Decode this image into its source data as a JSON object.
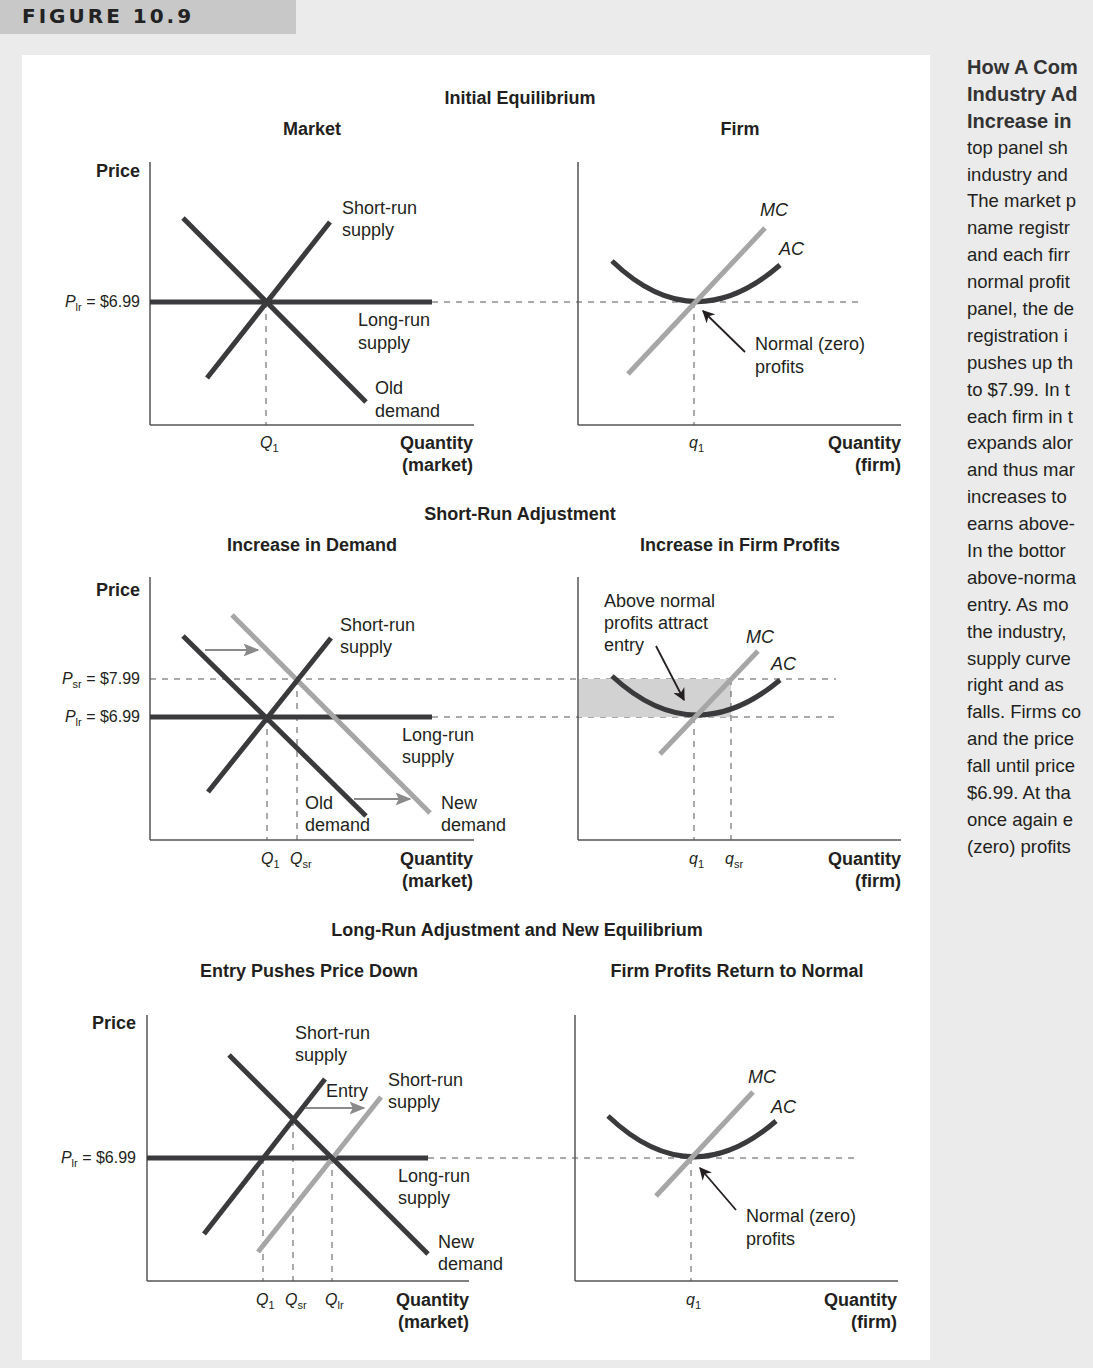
{
  "figure": {
    "label": "FIGURE 10.9",
    "caption_lines": [
      "How A Com",
      "Industry Ad",
      "Increase in",
      "top panel sh",
      "industry and",
      "The market p",
      "name registr",
      "and each firr",
      "normal profit",
      "panel, the de",
      "registration i",
      "pushes up th",
      "to $7.99. In t",
      "each firm in t",
      "expands alor",
      "and thus mar",
      "increases to",
      "earns above-",
      "In the bottor",
      "above-norma",
      "entry. As mo",
      "the industry,",
      "supply curve",
      "right and as",
      "falls. Firms co",
      "and the price",
      "fall until price",
      "$6.99. At tha",
      "once again e",
      "(zero) profits"
    ],
    "caption_bold_lines": 3
  },
  "rows": [
    {
      "title": "Initial Equilibrium",
      "market_title": "Market",
      "firm_title": "Firm"
    },
    {
      "title": "Short-Run Adjustment",
      "market_title": "Increase in Demand",
      "firm_title": "Increase in Firm Profits"
    },
    {
      "title": "Long-Run Adjustment and New Equilibrium",
      "market_title": "Entry Pushes Price Down",
      "firm_title": "Firm Profits Return to Normal"
    }
  ],
  "labels": {
    "price": "Price",
    "quantity": "Quantity",
    "market_paren": "(market)",
    "firm_paren": "(firm)",
    "p_lr_main": "P",
    "p_lr_sub": "lr",
    "p_lr_value": " = $6.99",
    "p_sr_main": "P",
    "p_sr_sub": "sr",
    "p_sr_value": " = $7.99",
    "Q": "Q",
    "q": "q",
    "sub_1": "1",
    "sub_sr": "sr",
    "sub_lr": "lr",
    "short_run": "Short-run",
    "supply": "supply",
    "long_run": "Long-run",
    "old": "Old",
    "new": "New",
    "demand": "demand",
    "mc": "MC",
    "ac": "AC",
    "normal_zero": "Normal (zero)",
    "profits": "profits",
    "above_normal": "Above normal",
    "profits_attract": "profits attract",
    "entry_lc": "entry",
    "entry": "Entry"
  },
  "colors": {
    "dark_curve": "#3a3a3c",
    "light_curve": "#a6a6a6",
    "arrow_gray": "#8a8a8a",
    "profit_shade": "#d2d2d2",
    "page_bg": "#ebebeb",
    "header_bg": "#c8c8c8"
  },
  "chart_data": [
    {
      "type": "line",
      "title": "Initial Equilibrium — Market",
      "xlabel": "Quantity (market)",
      "ylabel": "Price",
      "y_ticks": [
        "P_lr = $6.99"
      ],
      "x_ticks": [
        "Q1"
      ],
      "series": [
        {
          "name": "Short-run supply",
          "slope": "up"
        },
        {
          "name": "Long-run supply",
          "value": 6.99,
          "slope": "flat"
        },
        {
          "name": "Old demand",
          "slope": "down"
        }
      ],
      "equilibrium": {
        "price": 6.99,
        "quantity": "Q1"
      }
    },
    {
      "type": "line",
      "title": "Initial Equilibrium — Firm",
      "xlabel": "Quantity (firm)",
      "x_ticks": [
        "q1"
      ],
      "series": [
        {
          "name": "MC",
          "slope": "up"
        },
        {
          "name": "AC",
          "shape": "U"
        }
      ],
      "annotations": [
        "Normal (zero) profits"
      ],
      "equilibrium": {
        "price": 6.99,
        "quantity": "q1"
      }
    },
    {
      "type": "line",
      "title": "Short-Run Adjustment — Increase in Demand",
      "xlabel": "Quantity (market)",
      "ylabel": "Price",
      "y_ticks": [
        "P_sr = $7.99",
        "P_lr = $6.99"
      ],
      "x_ticks": [
        "Q1",
        "Qsr"
      ],
      "series": [
        {
          "name": "Short-run supply",
          "slope": "up"
        },
        {
          "name": "Long-run supply",
          "value": 6.99,
          "slope": "flat"
        },
        {
          "name": "Old demand",
          "slope": "down"
        },
        {
          "name": "New demand",
          "slope": "down",
          "shift": "right"
        }
      ],
      "equilibrium": {
        "price": 7.99,
        "quantity": "Qsr"
      }
    },
    {
      "type": "line",
      "title": "Short-Run Adjustment — Increase in Firm Profits",
      "xlabel": "Quantity (firm)",
      "x_ticks": [
        "q1",
        "qsr"
      ],
      "series": [
        {
          "name": "MC",
          "slope": "up"
        },
        {
          "name": "AC",
          "shape": "U"
        }
      ],
      "annotations": [
        "Above normal profits attract entry"
      ],
      "shaded_region": {
        "price_from": 6.99,
        "price_to": 7.99,
        "quantity_to": "qsr"
      }
    },
    {
      "type": "line",
      "title": "Long-Run Adjustment — Entry Pushes Price Down",
      "xlabel": "Quantity (market)",
      "ylabel": "Price",
      "y_ticks": [
        "P_lr = $6.99"
      ],
      "x_ticks": [
        "Q1",
        "Qsr",
        "Qlr"
      ],
      "series": [
        {
          "name": "Short-run supply (old)",
          "slope": "up"
        },
        {
          "name": "Short-run supply (new)",
          "slope": "up",
          "shift": "right"
        },
        {
          "name": "Long-run supply",
          "value": 6.99,
          "slope": "flat"
        },
        {
          "name": "New demand",
          "slope": "down"
        }
      ],
      "annotations": [
        "Entry"
      ],
      "equilibrium": {
        "price": 6.99,
        "quantity": "Qlr"
      }
    },
    {
      "type": "line",
      "title": "Long-Run Adjustment — Firm Profits Return to Normal",
      "xlabel": "Quantity (firm)",
      "x_ticks": [
        "q1"
      ],
      "series": [
        {
          "name": "MC",
          "slope": "up"
        },
        {
          "name": "AC",
          "shape": "U"
        }
      ],
      "annotations": [
        "Normal (zero) profits"
      ],
      "equilibrium": {
        "price": 6.99,
        "quantity": "q1"
      }
    }
  ]
}
